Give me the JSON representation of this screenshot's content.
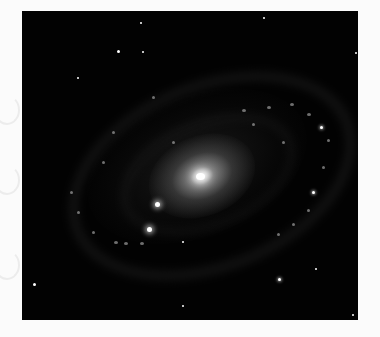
{
  "image": {
    "subject": "spiral galaxy",
    "description": "Grayscale astronomical image of a spiral galaxy with bright elliptical core and knotted spiral arms against a black sky with foreground stars",
    "colors": {
      "background": "#fbfbfb",
      "sky": "#020202",
      "core": "#ffffff",
      "arms": "#8a8a8a"
    }
  }
}
